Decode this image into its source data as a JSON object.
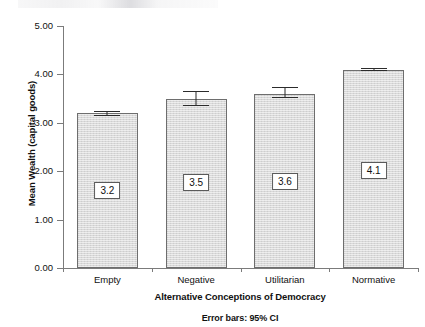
{
  "chart_data": {
    "type": "bar",
    "title": "",
    "xlabel": "Alternative Conceptions of Democracy",
    "ylabel": "Mean Wealth (capital goods)",
    "footnote": "Error bars: 95% CI",
    "categories": [
      "Empty",
      "Negative",
      "Utilitarian",
      "Normative"
    ],
    "values": [
      3.2,
      3.5,
      3.6,
      4.1
    ],
    "value_labels": [
      "3.2",
      "3.5",
      "3.6",
      "4.1"
    ],
    "errors": [
      {
        "low": 3.16,
        "high": 3.25,
        "half_width": 0.045
      },
      {
        "low": 3.37,
        "high": 3.65,
        "half_width": 0.14
      },
      {
        "low": 3.53,
        "high": 3.73,
        "half_width": 0.1
      },
      {
        "low": 4.09,
        "high": 4.13,
        "half_width": 0.02
      }
    ],
    "error_type": "95% CI",
    "ylim": [
      0.0,
      5.0
    ],
    "ytick_values": [
      0.0,
      1.0,
      2.0,
      3.0,
      4.0,
      5.0
    ],
    "ytick_labels": [
      "0.00",
      "1.00",
      "2.00",
      "3.00",
      "4.00",
      "5.00"
    ],
    "grid": false,
    "legend": false,
    "bar_fill_color": "#d9d9d9",
    "bar_border_color": "#6e6e6e",
    "axis_color": "#7b7b7b",
    "error_bar_color": "#2b2b2b"
  }
}
